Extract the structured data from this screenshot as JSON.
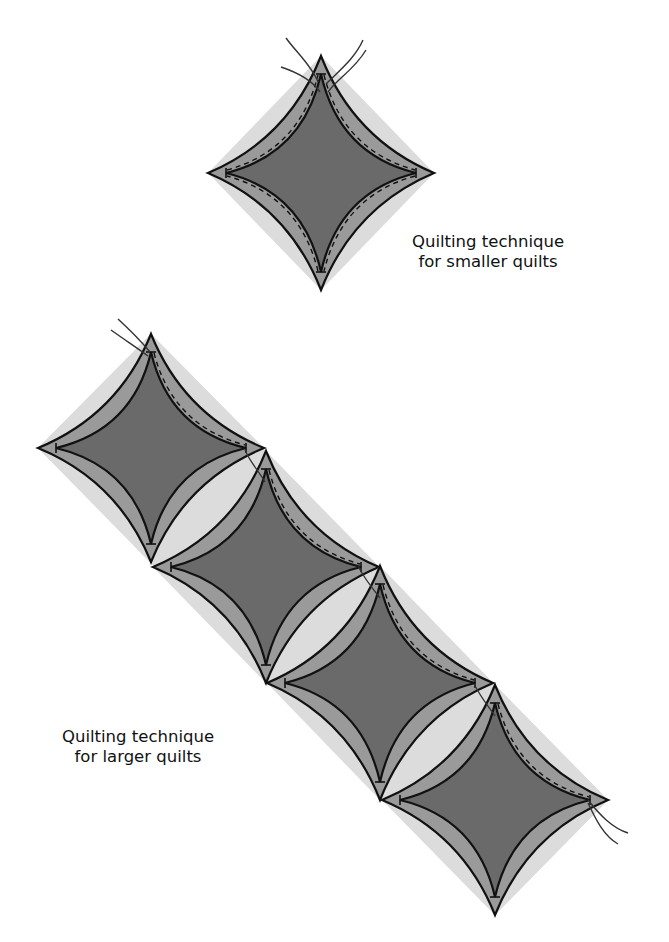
{
  "captions": {
    "smaller": {
      "line1": "Quilting technique",
      "line2": "for smaller quilts"
    },
    "larger": {
      "line1": "Quilting technique",
      "line2": "for larger quilts"
    }
  },
  "colors": {
    "background": "#ffffff",
    "shadow": "#dcdcdc",
    "outer_band": "#9a9a9a",
    "center": "#6a6a6a",
    "stroke": "#111111",
    "thread": "#333333"
  },
  "diagrams": {
    "single": {
      "label": "smaller quilts",
      "diamonds": [
        {
          "cx": 321,
          "cy": 173,
          "rx": 113,
          "ry": 117
        }
      ]
    },
    "chain": {
      "label": "larger quilts",
      "diamonds": [
        {
          "cx": 151,
          "cy": 448,
          "rx": 113,
          "ry": 114
        },
        {
          "cx": 266,
          "cy": 567,
          "rx": 113,
          "ry": 116
        },
        {
          "cx": 380,
          "cy": 683,
          "rx": 113,
          "ry": 117
        },
        {
          "cx": 495,
          "cy": 800,
          "rx": 113,
          "ry": 115
        }
      ]
    }
  }
}
